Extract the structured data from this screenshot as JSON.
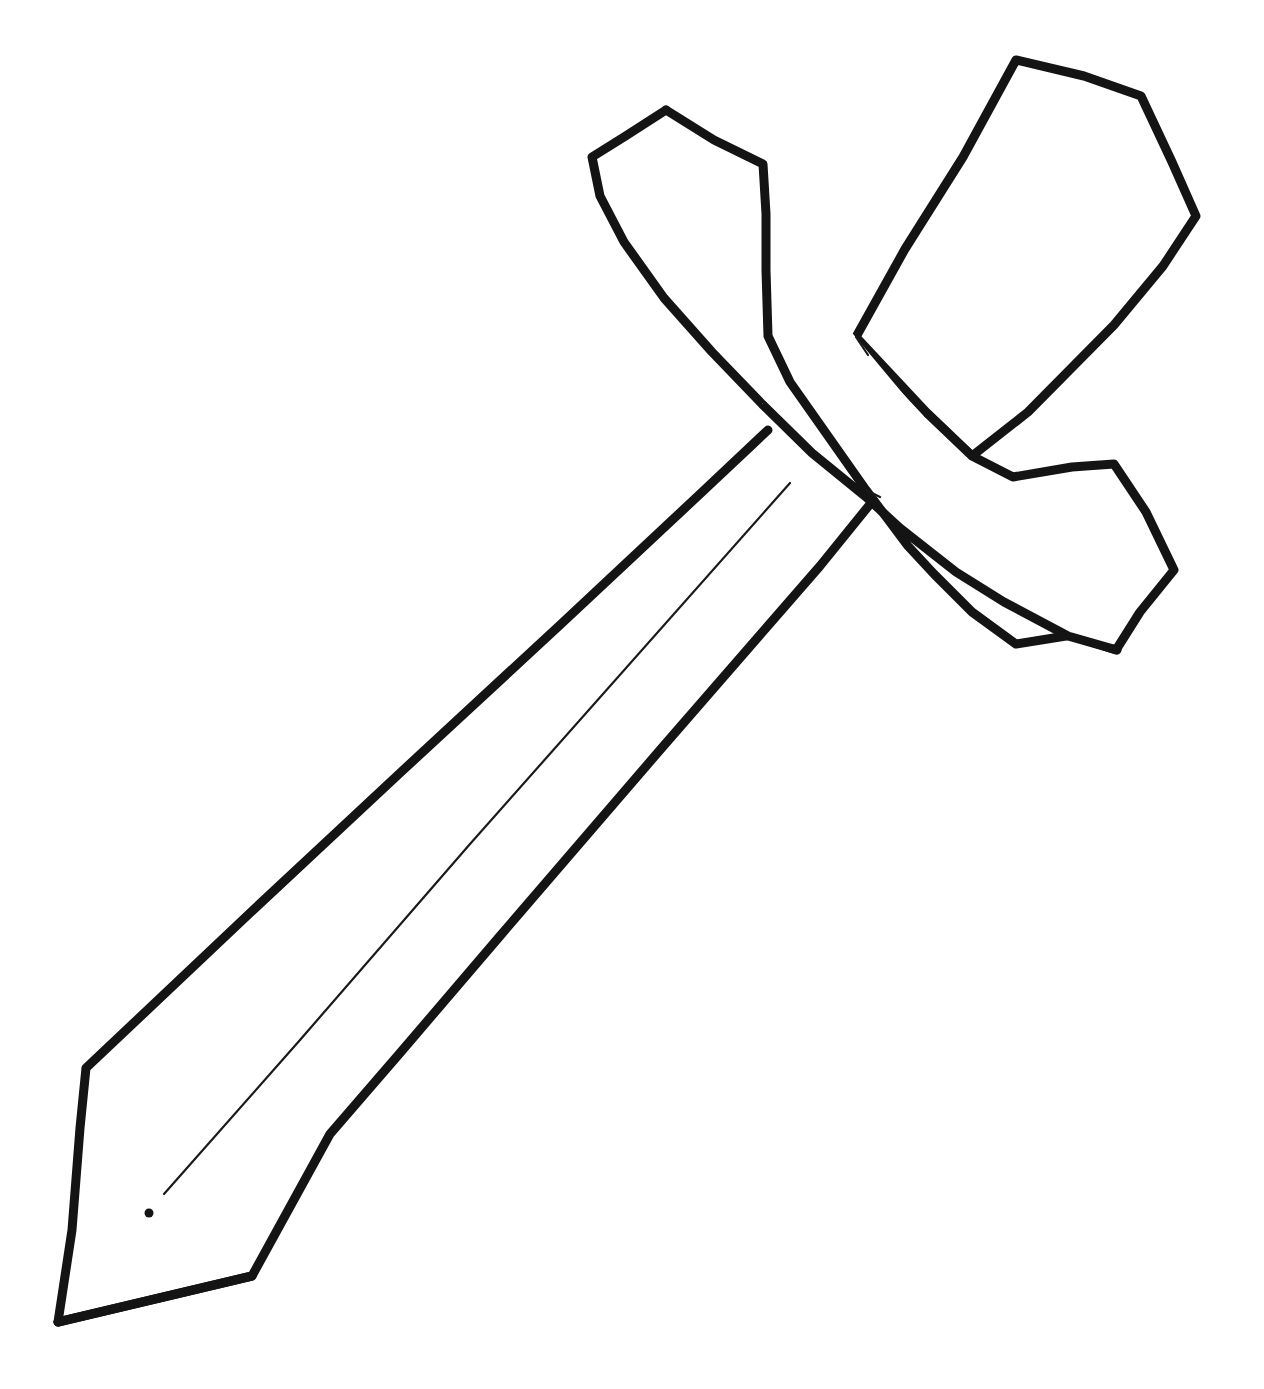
{
  "document": {
    "kind": "line-art-coloring-page",
    "title": "Sword",
    "subject": "sword",
    "background_color": "#ffffff",
    "ink_color": "#141414",
    "width": 1264,
    "height": 1389,
    "text_content": "",
    "has_text": false,
    "stroke_style": "hand-drawn black outline, no fill, no shading"
  },
  "palette": {
    "paper": "#ffffff",
    "outline": "#141414",
    "detail_line": "#1a1a1a"
  },
  "strokes": {
    "thick_width": 9,
    "thin_width": 2.2,
    "linecap": "round",
    "linejoin": "round"
  },
  "parts": [
    {
      "id": "grip",
      "label": "Grip / Handle",
      "description": "Tapered pentagon handle rising up-left from the crossguard"
    },
    {
      "id": "crossguard-upper-wing",
      "label": "Crossguard Upper Wing",
      "description": "Large angular blade-like wing sweeping up to the top right"
    },
    {
      "id": "crossguard-lower-wing",
      "label": "Crossguard Lower Wing",
      "description": "Angular wing sweeping down to the lower right"
    },
    {
      "id": "blade",
      "label": "Blade",
      "description": "Long tapering blade pointing to the lower left with a pointed tip"
    },
    {
      "id": "fuller",
      "label": "Fuller Line",
      "description": "Thin center groove line running down the blade"
    },
    {
      "id": "fuller-dot",
      "label": "Fuller End Dot",
      "description": "Small ink dot near the end of the fuller line"
    }
  ],
  "geometry": {
    "grip_outline": "M 666 110 L 593 156 L 601 194 L 636 258 L 700 336 L 751 385 L 800 432 L 854 482 L 866 489 L 862 476 L 830 436 L 791 383 L 768 336 L 766 270 L 767 200 L 763 163 Z",
    "crossguard_upper_wing": "M 1018 59 L 1139 95 L 1178 179 L 1196 217 L 1165 267 L 1120 322 L 1021 418 L 971 455 L 927 415 L 866 489 L 854 482 L 791 383 L 768 336 L 847 336 L 908 246 L 963 160 Z",
    "crossguard_lower_wing": "M 927 415 L 971 455 L 1012 476 L 1073 466 L 1113 464 L 1146 512 L 1173 571 L 1140 612 L 1115 648 L 1069 634 L 1003 597 L 938 547 L 885 500 L 866 489 Z",
    "blade_outline": "M 768 336 L 791 383 L 830 436 L 862 476 L 866 489 L 854 482 L 800 432 L 751 385 L 700 336 Z",
    "blade_body": "M 763 425 L 866 489 L 812 556 L 495 933 L 398 1049 L 329 1134 L 248 1278 L 57 1325 L 79 1230 L 85 1125 L 140 1056 L 440 777 L 640 560 Z",
    "fuller_line": "M 790 483 L 163 1195",
    "fuller_dot": {
      "cx": 149,
      "cy": 1213,
      "r": 4.5
    }
  },
  "vertices": {
    "grip_top_apex": [
      666,
      110
    ],
    "grip_left_shoulder": [
      593,
      156
    ],
    "grip_right_shoulder": [
      763,
      163
    ],
    "blade_tip": [
      57,
      1325
    ],
    "blade_left_kink": [
      85,
      1125
    ],
    "blade_right_kink": [
      248,
      1278
    ],
    "crossguard_upper_tip": [
      1196,
      217
    ],
    "crossguard_lower_tip": [
      1173,
      571
    ],
    "cross_center": [
      866,
      489
    ]
  }
}
